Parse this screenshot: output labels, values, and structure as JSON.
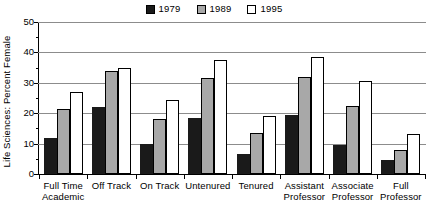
{
  "chart_data": {
    "type": "bar",
    "title": "",
    "xlabel": "",
    "ylabel": "Life Sciences: Percent Female",
    "ylim": [
      0,
      50
    ],
    "ytick_labels": [
      "0",
      "10",
      "20",
      "30",
      "40",
      "50"
    ],
    "ytick_values": [
      0,
      10,
      20,
      30,
      40,
      50
    ],
    "yminor_values": [
      5,
      15,
      25,
      35,
      45
    ],
    "grid": true,
    "legend_position": "top-center",
    "categories": [
      "Full Time Academic",
      "Off Track",
      "On Track",
      "Untenured",
      "Tenured",
      "Assistant Professor",
      "Associate Professor",
      "Full Professor"
    ],
    "category_lines": [
      [
        "Full Time",
        "Academic"
      ],
      [
        "Off Track",
        ""
      ],
      [
        "On Track",
        ""
      ],
      [
        "Untenured",
        ""
      ],
      [
        "Tenured",
        ""
      ],
      [
        "Assistant",
        "Professor"
      ],
      [
        "Associate",
        "Professor"
      ],
      [
        "Full",
        "Professor"
      ]
    ],
    "series": [
      {
        "name": "1979",
        "color": "#1a1a1a",
        "values": [
          12,
          22,
          10,
          18.5,
          6.5,
          19.5,
          9.5,
          4.5
        ]
      },
      {
        "name": "1989",
        "color": "#a8a8a8",
        "values": [
          21.5,
          34,
          18,
          31.5,
          13.5,
          32,
          22.5,
          8
        ]
      },
      {
        "name": "1995",
        "color": "#ffffff",
        "values": [
          27,
          35,
          24.5,
          37.5,
          19,
          38.5,
          30.5,
          13
        ]
      }
    ]
  },
  "legend": {
    "entries": [
      {
        "label": "1979"
      },
      {
        "label": "1989"
      },
      {
        "label": "1995"
      }
    ]
  },
  "axes": {
    "y_title": "Life Sciences: Percent Female"
  }
}
